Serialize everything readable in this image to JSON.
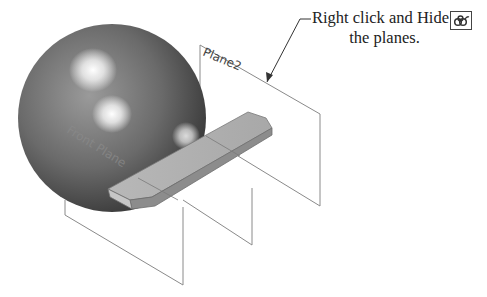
{
  "figure": {
    "callout": {
      "line1": "Right click and Hide",
      "line2": "the planes."
    },
    "labels": {
      "plane2": "Plane2",
      "front_plane": "Front Plane"
    },
    "icons": {
      "hide_icon": "hide-glasses-icon"
    },
    "colors": {
      "plane_edge": "#8a8a8a",
      "sphere_dark": "#3a3a3a",
      "sphere_light": "#f2f2f2",
      "part_face": "#b4b4b4",
      "part_edge": "#6e6e6e",
      "leader": "#333333"
    }
  }
}
